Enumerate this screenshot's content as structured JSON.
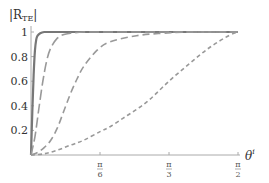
{
  "chart_data": {
    "type": "line",
    "title": "",
    "ylabel": "|R_TE|",
    "ylabel_main": "|R",
    "ylabel_sub": "TE",
    "ylabel_close": "|",
    "xlabel": "θ^i",
    "xlabel_main": "θ",
    "xlabel_sup": "i",
    "xlim": [
      0,
      1.5708
    ],
    "ylim": [
      0,
      1
    ],
    "grid": false,
    "legend": null,
    "y_ticks": [
      {
        "value": 0.2,
        "label": "0.2"
      },
      {
        "value": 0.4,
        "label": "0.4"
      },
      {
        "value": 0.6,
        "label": "0.6"
      },
      {
        "value": 0.8,
        "label": "0.8"
      },
      {
        "value": 1.0,
        "label": "1"
      }
    ],
    "x_ticks": [
      {
        "value": 0.5236,
        "num": "π",
        "den": "6",
        "label": "π/6"
      },
      {
        "value": 1.0472,
        "num": "π",
        "den": "3",
        "label": "π/3"
      },
      {
        "value": 1.5708,
        "num": "π",
        "den": "2",
        "label": "π/2"
      }
    ],
    "series": [
      {
        "name": "curve-1-solid",
        "style": "solid",
        "color": "#777777",
        "width": 2.2,
        "dash": "",
        "x": [
          0,
          0.01,
          0.02,
          0.03,
          0.04,
          0.05,
          0.07,
          0.1,
          0.15,
          0.3,
          0.6,
          1.0,
          1.5708
        ],
        "y": [
          0,
          0.35,
          0.65,
          0.85,
          0.94,
          0.97,
          0.99,
          1.0,
          1.0,
          1.0,
          1.0,
          1.0,
          1.0
        ]
      },
      {
        "name": "curve-2-long-dash",
        "style": "long-dash",
        "color": "#999999",
        "width": 1.6,
        "dash": "10,4",
        "x": [
          0,
          0.03,
          0.06,
          0.09,
          0.12,
          0.15,
          0.2,
          0.25,
          0.3,
          0.4,
          0.6,
          1.0,
          1.5708
        ],
        "y": [
          0,
          0.15,
          0.38,
          0.6,
          0.77,
          0.87,
          0.95,
          0.98,
          0.99,
          1.0,
          1.0,
          1.0,
          1.0
        ]
      },
      {
        "name": "curve-3-medium-dash",
        "style": "medium-dash",
        "color": "#999999",
        "width": 1.6,
        "dash": "7,4",
        "x": [
          0,
          0.05,
          0.1,
          0.15,
          0.2,
          0.25,
          0.3,
          0.35,
          0.4,
          0.5,
          0.6,
          0.8,
          1.0,
          1.2,
          1.5708
        ],
        "y": [
          0,
          0.02,
          0.06,
          0.12,
          0.22,
          0.36,
          0.5,
          0.62,
          0.72,
          0.85,
          0.92,
          0.97,
          0.99,
          1.0,
          1.0
        ]
      },
      {
        "name": "curve-4-short-dash",
        "style": "short-dash",
        "color": "#999999",
        "width": 1.6,
        "dash": "4,3",
        "x": [
          0,
          0.1,
          0.2,
          0.3,
          0.4,
          0.5236,
          0.6,
          0.7,
          0.8,
          0.9,
          1.0472,
          1.2,
          1.35,
          1.5,
          1.5708
        ],
        "y": [
          0,
          0.01,
          0.04,
          0.08,
          0.12,
          0.19,
          0.23,
          0.3,
          0.37,
          0.45,
          0.6,
          0.74,
          0.87,
          0.97,
          1.0
        ]
      }
    ]
  }
}
